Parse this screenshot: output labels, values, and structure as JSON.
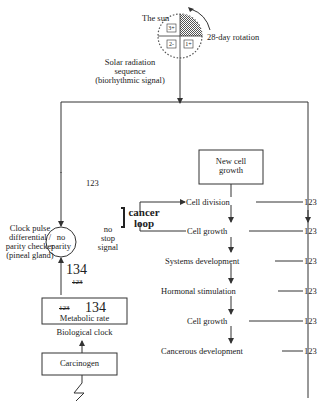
{
  "sun": {
    "label": "The sun",
    "rotation_label": "28-day rotation",
    "quadrants": [
      "3+",
      "2-",
      "1+"
    ]
  },
  "signal": {
    "line1": "Solar radiation",
    "line2": "sequence",
    "line3": "(biorhythmic signal)"
  },
  "left_branch": {
    "code": "123",
    "checker_label_lines": [
      "Clock pulse",
      "differential /",
      "parity checker",
      "(pineal gland)"
    ],
    "circle_lines": [
      "no",
      "parity"
    ],
    "no_stop_lines": [
      "no",
      "stop",
      "signal"
    ],
    "cancer_loop_lines": [
      "cancer",
      "loop"
    ],
    "new_code": "134",
    "old_code_crossed": "123"
  },
  "clock_box": {
    "old_code_crossed": "123",
    "new_code": "134",
    "label": "Metabolic rate",
    "caption": "Biological clock"
  },
  "carcinogen": {
    "label": "Carcinogen"
  },
  "new_cell_box": {
    "lines": [
      "New cell",
      "growth"
    ]
  },
  "stages": [
    {
      "label": "Cell division",
      "code": "123"
    },
    {
      "label": "Cell growth",
      "code": "123"
    },
    {
      "label": "Systems development",
      "code": "123"
    },
    {
      "label": "Hormonal stimulation",
      "code": "123"
    },
    {
      "label": "Cell growth",
      "code": "123"
    },
    {
      "label": "Cancerous development",
      "code": "123"
    }
  ],
  "colors": {
    "line": "#333333",
    "text": "#222222"
  }
}
